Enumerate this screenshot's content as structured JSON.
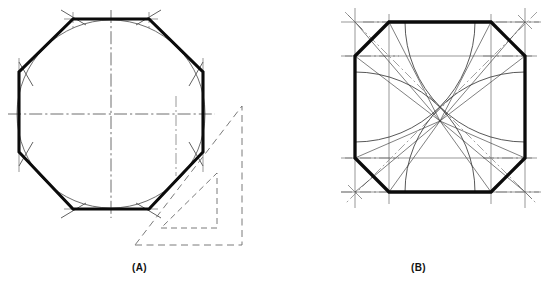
{
  "figure": {
    "background_color": "#ffffff",
    "line_color": "#0b0b0b",
    "construction_color": "#6b6b6b",
    "width": 558,
    "height": 288
  },
  "panels": [
    {
      "id": "A",
      "caption": "(A)",
      "method": "Octagon circumscribed about a circle using a 45-degree triangle",
      "shape": "regular-octagon",
      "sides": 8,
      "center": {
        "x": 111,
        "y": 114
      },
      "inradius": 95,
      "flat_to_flat": 190,
      "inscribed_circle": {
        "cx": 111,
        "cy": 114,
        "r": 94
      },
      "centerlines": {
        "horizontal": true,
        "vertical": true
      },
      "tool": {
        "name": "45-degree-drafting-triangle",
        "style": "dashed",
        "angles": [
          45,
          45,
          90
        ]
      }
    },
    {
      "id": "B",
      "caption": "(B)",
      "method": "Octagon inscribed in a square using arcs struck from the corners",
      "shape": "regular-octagon",
      "sides": 8,
      "center": {
        "x": 161,
        "y": 121
      },
      "square": {
        "x": 76,
        "y": 22,
        "size": 170
      },
      "arc_radius": 85,
      "arc_count": 4,
      "diagonals": 2,
      "centerlines": {
        "horizontal": true,
        "vertical": true
      }
    }
  ],
  "captions": {
    "a": "(A)",
    "b": "(B)"
  }
}
